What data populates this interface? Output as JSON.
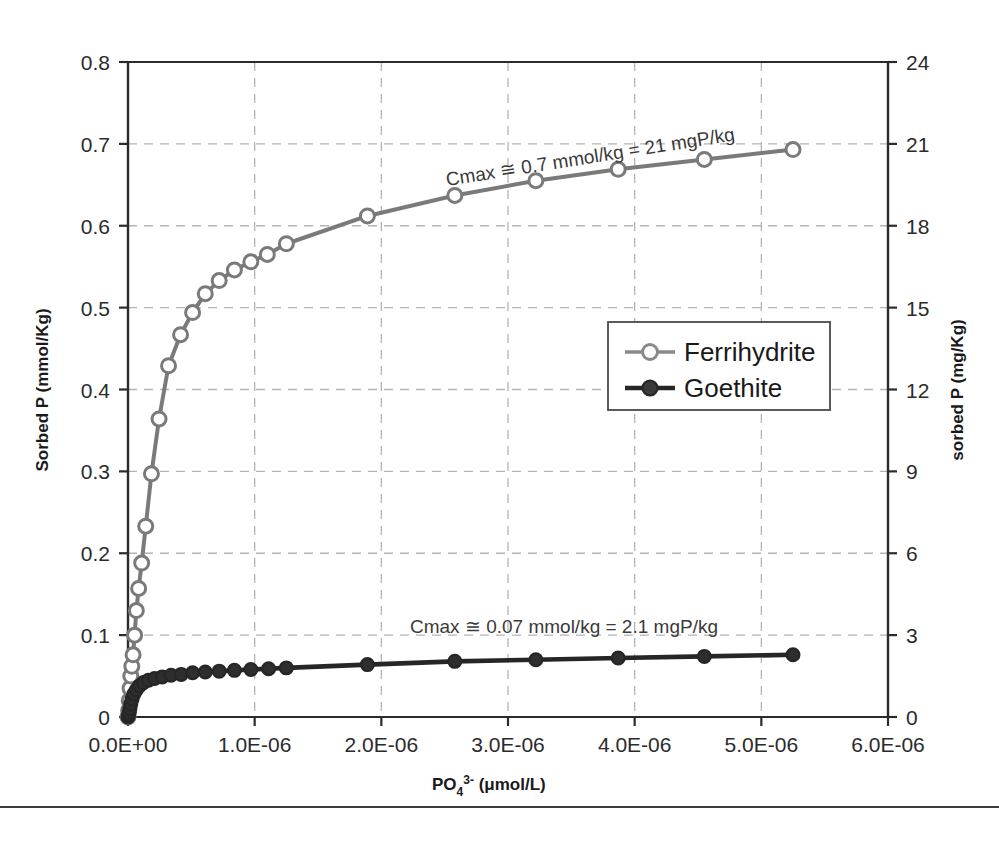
{
  "chart_data": {
    "type": "line",
    "title": "",
    "xlabel": "PO4 3- (μmol/L)",
    "ylabel": "Sorbed P (mmol/Kg)",
    "y2label": "sorbed P (mg/Kg)",
    "xlim": [
      0,
      6e-06
    ],
    "ylim": [
      0,
      0.8
    ],
    "y2lim": [
      0,
      24
    ],
    "grid": true,
    "legend_position": "center-right",
    "xticks": [
      0,
      1e-06,
      2e-06,
      3e-06,
      4e-06,
      5e-06,
      6e-06
    ],
    "xticklabels": [
      "0.0E+00",
      "1.0E-06",
      "2.0E-06",
      "3.0E-06",
      "4.0E-06",
      "5.0E-06",
      "6.0E-06"
    ],
    "yticks": [
      0,
      0.1,
      0.2,
      0.3,
      0.4,
      0.5,
      0.6,
      0.7,
      0.8
    ],
    "yticklabels": [
      "0",
      "0.1",
      "0.2",
      "0.3",
      "0.4",
      "0.5",
      "0.6",
      "0.7",
      "0.8"
    ],
    "y2ticks": [
      0,
      3,
      6,
      9,
      12,
      15,
      18,
      21,
      24
    ],
    "y2ticklabels": [
      "0",
      "3",
      "6",
      "9",
      "12",
      "15",
      "18",
      "21",
      "24"
    ],
    "series": [
      {
        "name": "Ferrihydrite",
        "marker": "open-circle",
        "color": "#7a7a7a",
        "x": [
          0.0,
          5e-09,
          1e-08,
          1.6e-08,
          2.2e-08,
          3e-08,
          4e-08,
          5.2e-08,
          6.6e-08,
          8.4e-08,
          1.08e-07,
          1.4e-07,
          1.85e-07,
          2.45e-07,
          3.2e-07,
          4.15e-07,
          5.1e-07,
          6.1e-07,
          7.2e-07,
          8.4e-07,
          9.7e-07,
          1.1e-06,
          1.25e-06,
          1.89e-06,
          2.58e-06,
          3.22e-06,
          3.87e-06,
          4.55e-06,
          5.25e-06
        ],
        "y": [
          0.0,
          0.008,
          0.02,
          0.035,
          0.05,
          0.062,
          0.076,
          0.1,
          0.13,
          0.157,
          0.188,
          0.233,
          0.297,
          0.364,
          0.429,
          0.467,
          0.494,
          0.517,
          0.533,
          0.546,
          0.556,
          0.565,
          0.578,
          0.612,
          0.637,
          0.655,
          0.669,
          0.681,
          0.693
        ]
      },
      {
        "name": "Goethite",
        "marker": "filled-circle",
        "color": "#262626",
        "x": [
          0.0,
          4e-09,
          9e-09,
          1.5e-08,
          2.2e-08,
          3.2e-08,
          4.6e-08,
          6.5e-08,
          9e-08,
          1.22e-07,
          1.62e-07,
          2.1e-07,
          2.7e-07,
          3.4e-07,
          4.2e-07,
          5.1e-07,
          6.1e-07,
          7.2e-07,
          8.4e-07,
          9.7e-07,
          1.11e-06,
          1.25e-06,
          1.89e-06,
          2.58e-06,
          3.22e-06,
          3.87e-06,
          4.55e-06,
          5.25e-06
        ],
        "y": [
          0.0,
          0.002,
          0.005,
          0.01,
          0.016,
          0.022,
          0.028,
          0.033,
          0.038,
          0.042,
          0.045,
          0.047,
          0.049,
          0.051,
          0.052,
          0.054,
          0.055,
          0.056,
          0.057,
          0.058,
          0.059,
          0.06,
          0.064,
          0.068,
          0.07,
          0.072,
          0.074,
          0.076
        ]
      }
    ],
    "annotations": [
      {
        "id": "cmax-ferrihydrite",
        "text": "Cmax ≅ 0.7 mmol/kg = 21 mgP/kg",
        "x_px": 447,
        "y_px": 186,
        "rotation_deg": -9
      },
      {
        "id": "cmax-goethite",
        "text": "Cmax ≅ 0.07 mmol/kg = 2.1 mgP/kg",
        "x_px": 410,
        "y_px": 633,
        "rotation_deg": 0
      }
    ]
  },
  "legend": {
    "entries": [
      {
        "label": "Ferrihydrite",
        "marker": "open-circle",
        "color": "#7a7a7a"
      },
      {
        "label": "Goethite",
        "marker": "filled-circle",
        "color": "#262626"
      }
    ]
  },
  "axes": {
    "left_title": "Sorbed P (mmol/Kg)",
    "right_title": "sorbed P (mg/Kg)",
    "bottom_title_parts": {
      "base": "PO",
      "sub": "4",
      "sup": "3-",
      "units": " (μmol/L)"
    }
  },
  "colors": {
    "ferrihydrite": "#7a7a7a",
    "goethite": "#262626",
    "axis": "#2b2b2b",
    "grid": "#b4b4b4",
    "background": "#ffffff"
  }
}
